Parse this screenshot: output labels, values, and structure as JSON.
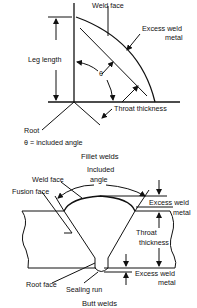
{
  "fillet": {
    "caption": "Fillet welds",
    "labels": {
      "weld_face": "Weld face",
      "excess_weld_1": "Excess weld",
      "excess_weld_2": "metal",
      "leg_length": "Leg length",
      "theta": "θ",
      "throat_thickness": "Throat thickness",
      "root": "Root",
      "legend": "θ = included angle"
    }
  },
  "butt": {
    "caption": "Butt welds",
    "labels": {
      "included_1": "Included",
      "included_2": "angle",
      "weld_face": "Weld face",
      "fusion_face": "Fusion face",
      "excess_top_1": "Excess weld",
      "excess_top_2": "metal",
      "throat_1": "Throat",
      "throat_2": "thickness",
      "excess_bottom_1": "Excess weld",
      "excess_bottom_2": "metal",
      "root_face": "Root face",
      "sealing_run": "Sealing run"
    }
  },
  "colors": {
    "line": "#111111",
    "background": "#ffffff"
  }
}
